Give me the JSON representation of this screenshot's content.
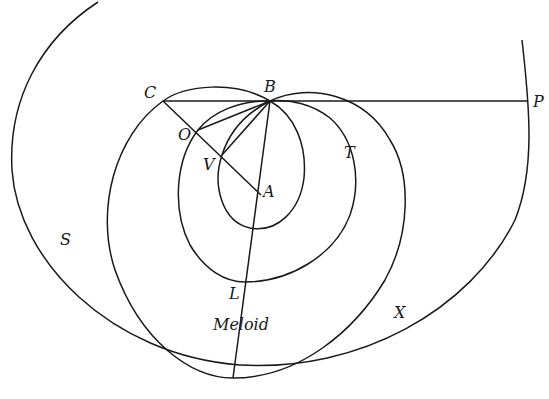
{
  "diagram": {
    "type": "geometric-construction",
    "labels": {
      "B": "B",
      "C": "C",
      "P": "P",
      "O": "O",
      "V": "V",
      "A": "A",
      "T": "T",
      "S": "S",
      "L": "L",
      "X": "X",
      "meloid": "Meloid"
    },
    "curves": [
      "large-circle",
      "outer-meloid",
      "middle-curve",
      "inner-loop"
    ],
    "segments": [
      "C-P",
      "C-A",
      "B-O",
      "B-V",
      "B-bottom"
    ],
    "stroke_color": "#1a1a1a",
    "background_color": "#ffffff"
  }
}
